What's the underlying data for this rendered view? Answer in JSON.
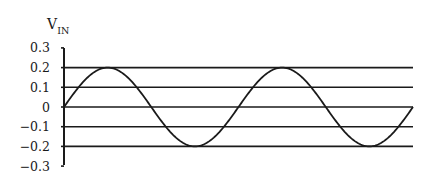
{
  "chart_data": {
    "type": "line",
    "title": "",
    "xlabel": "",
    "ylabel": "V_IN",
    "ylabel_main": "V",
    "ylabel_sub": "IN",
    "ylim": [
      -0.3,
      0.3
    ],
    "yticks": [
      0.3,
      0.2,
      0.1,
      0,
      -0.1,
      -0.2,
      -0.3
    ],
    "ytick_labels": [
      "0.3",
      "0.2",
      "0.1",
      "0",
      "−0.1",
      "−0.2",
      "−0.3"
    ],
    "gridlines_at": [
      0.2,
      0.1,
      0,
      -0.1,
      -0.2
    ],
    "grid": true,
    "legend": null,
    "series": [
      {
        "name": "V_IN",
        "function": "sine",
        "amplitude": 0.2,
        "cycles": 2,
        "phase_start": 0,
        "color": "#1a1a1a",
        "points_x_fraction": [
          0,
          0.125,
          0.25,
          0.375,
          0.5,
          0.625,
          0.75,
          0.875,
          1
        ],
        "values": [
          0,
          0.2,
          0,
          -0.2,
          0,
          0.2,
          0,
          -0.2,
          0
        ]
      }
    ]
  },
  "colors": {
    "line": "#1a1a1a",
    "background": "#ffffff"
  }
}
